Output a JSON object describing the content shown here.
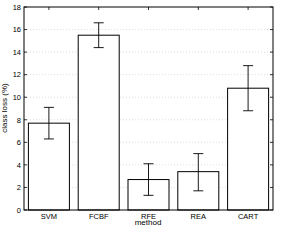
{
  "chart_data": {
    "type": "bar",
    "title": "",
    "xlabel": "method",
    "ylabel": "class loss (%)",
    "categories": [
      "SVM",
      "FCBF",
      "RFE",
      "REA",
      "CART"
    ],
    "values": [
      7.7,
      15.5,
      2.7,
      3.4,
      10.8
    ],
    "error_low": [
      6.3,
      14.4,
      1.3,
      1.7,
      8.8
    ],
    "error_high": [
      9.1,
      16.6,
      4.1,
      5.0,
      12.8
    ],
    "ylim": [
      0,
      18
    ],
    "yticks": [
      0,
      2,
      4,
      6,
      8,
      10,
      12,
      14,
      16,
      18
    ],
    "grid": true,
    "legend": null
  }
}
